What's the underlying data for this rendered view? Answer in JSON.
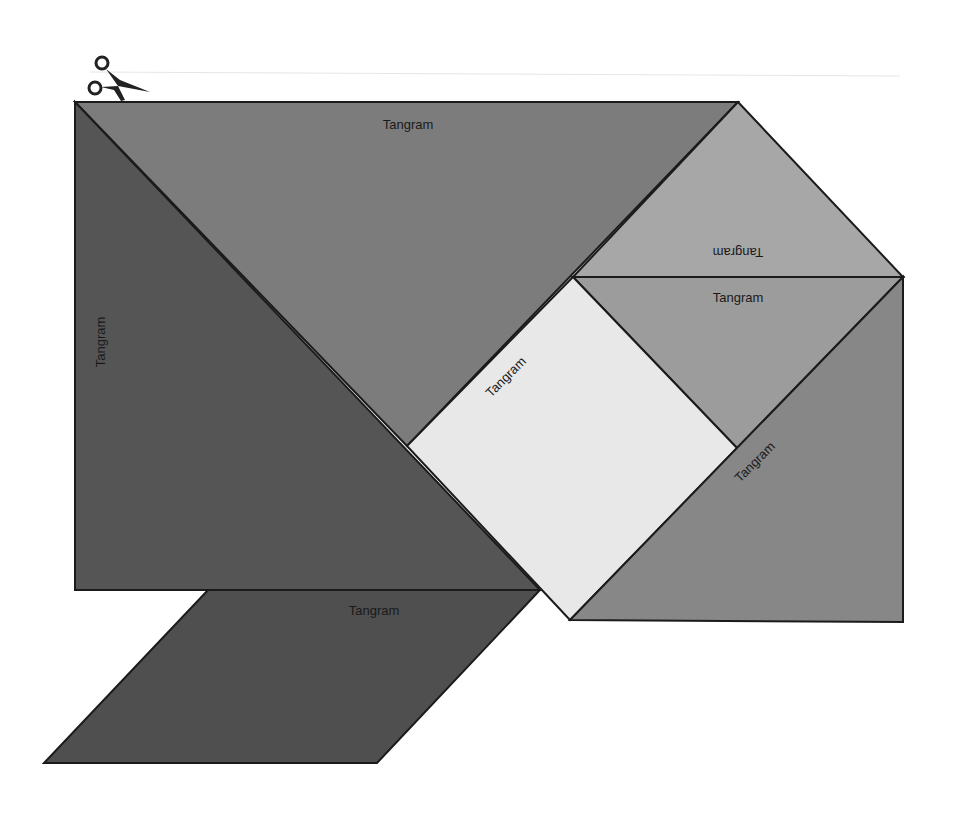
{
  "sheet": {
    "cut_icon": "scissors-icon",
    "pieces": [
      {
        "id": "large-triangle-top",
        "label": "Tangram",
        "color": "#7c7c7c"
      },
      {
        "id": "large-triangle-left",
        "label": "Tangram",
        "color": "#555555"
      },
      {
        "id": "small-triangle-top-right",
        "label": "Tangram",
        "color": "#a7a7a7"
      },
      {
        "id": "medium-triangle-right",
        "label": "Tangram",
        "color": "#9c9c9c"
      },
      {
        "id": "square",
        "label": "Tangram",
        "color": "#e8e8e8"
      },
      {
        "id": "large-triangle-bottom-right",
        "label": "Tangram",
        "color": "#878787"
      },
      {
        "id": "parallelogram",
        "label": "Tangram",
        "color": "#4f4f4f"
      }
    ]
  }
}
